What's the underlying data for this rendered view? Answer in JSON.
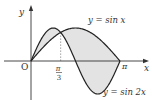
{
  "chart_data": {
    "type": "line",
    "title": "",
    "xlabel": "x",
    "ylabel": "y",
    "origin_label": "O",
    "x_range": [
      0,
      3.14159
    ],
    "y_range": [
      -1,
      1
    ],
    "grid": false,
    "x_ticks": [
      {
        "value": 1.0472,
        "label_num": "π",
        "label_den": "3",
        "guide": true
      },
      {
        "value": 3.14159,
        "label": "π"
      }
    ],
    "series": [
      {
        "name": "y=sin x",
        "expr": "sin(x)",
        "label": "y = sin x",
        "label_position": "top-right"
      },
      {
        "name": "y=sin 2x",
        "expr": "sin(2x)",
        "label": "y = sin 2x",
        "label_position": "bottom-right"
      }
    ],
    "shaded_region": {
      "between": [
        "sin(x)",
        "sin(2x)"
      ],
      "from": 0,
      "to": 3.14159,
      "color": "#e6e6e6"
    },
    "colors": {
      "curve": "#222222",
      "axis": "#333333",
      "fill": "#e3e3e3",
      "guide": "#888888"
    }
  }
}
